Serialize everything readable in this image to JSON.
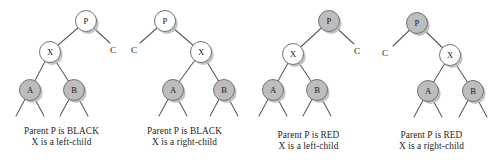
{
  "figure": {
    "kind": "red-black-tree-cases",
    "background": "#ffffff",
    "colors": {
      "node_fill_black": "#ffffff",
      "node_fill_red": "#bdbdbd",
      "node_stroke": "#6e6e6e",
      "edge_stroke": "#5a5a5a",
      "shadow": "#b8b8b8",
      "text": "#241f1f"
    },
    "geometry": {
      "node_radius": 10.5,
      "panel_width": 123,
      "panel_height": 166
    }
  },
  "panels": [
    {
      "id": "case-1",
      "x": 0,
      "caption": {
        "line1": "Parent P is BLACK",
        "line2": "X is a left-child",
        "top": 126
      },
      "nodes": [
        {
          "name": "node-p",
          "label": "P",
          "cx": 86,
          "cy": 21,
          "fill": "black"
        },
        {
          "name": "node-x",
          "label": "X",
          "cx": 50,
          "cy": 52,
          "fill": "black"
        },
        {
          "name": "node-a",
          "label": "A",
          "cx": 30,
          "cy": 90,
          "fill": "red"
        },
        {
          "name": "node-b",
          "label": "B",
          "cx": 74,
          "cy": 90,
          "fill": "red"
        }
      ],
      "ext_labels": [
        {
          "name": "label-c",
          "label": "C",
          "x": 113,
          "y": 50
        }
      ],
      "edges": [
        [
          86,
          21,
          50,
          52
        ],
        [
          86,
          21,
          110,
          43
        ],
        [
          50,
          52,
          30,
          90
        ],
        [
          50,
          52,
          74,
          90
        ],
        [
          30,
          90,
          16,
          116
        ],
        [
          30,
          90,
          44,
          116
        ],
        [
          74,
          90,
          60,
          116
        ],
        [
          74,
          90,
          88,
          116
        ]
      ]
    },
    {
      "id": "case-2",
      "x": 123,
      "caption": {
        "line1": "Parent P is BLACK",
        "line2": "X is a right-child",
        "top": 126
      },
      "nodes": [
        {
          "name": "node-p",
          "label": "P",
          "cx": 42,
          "cy": 21,
          "fill": "black"
        },
        {
          "name": "node-x",
          "label": "X",
          "cx": 78,
          "cy": 52,
          "fill": "black"
        },
        {
          "name": "node-a",
          "label": "A",
          "cx": 50,
          "cy": 90,
          "fill": "red"
        },
        {
          "name": "node-b",
          "label": "B",
          "cx": 101,
          "cy": 90,
          "fill": "red"
        }
      ],
      "ext_labels": [
        {
          "name": "label-c",
          "label": "C",
          "x": 11,
          "y": 50
        }
      ],
      "edges": [
        [
          42,
          21,
          78,
          52
        ],
        [
          42,
          21,
          17,
          43
        ],
        [
          78,
          52,
          50,
          90
        ],
        [
          78,
          52,
          101,
          90
        ],
        [
          50,
          90,
          36,
          116
        ],
        [
          50,
          90,
          64,
          116
        ],
        [
          101,
          90,
          87,
          116
        ],
        [
          101,
          90,
          115,
          116
        ]
      ]
    },
    {
      "id": "case-3",
      "x": 247,
      "caption": {
        "line1": "Parent P is RED",
        "line2": "X is a left-child",
        "top": 130
      },
      "nodes": [
        {
          "name": "node-p",
          "label": "P",
          "cx": 82,
          "cy": 21,
          "fill": "red"
        },
        {
          "name": "node-x",
          "label": "X",
          "cx": 46,
          "cy": 54,
          "fill": "black"
        },
        {
          "name": "node-a",
          "label": "A",
          "cx": 26,
          "cy": 90,
          "fill": "red"
        },
        {
          "name": "node-b",
          "label": "B",
          "cx": 70,
          "cy": 90,
          "fill": "red"
        }
      ],
      "ext_labels": [
        {
          "name": "label-c",
          "label": "C",
          "x": 110,
          "y": 51
        }
      ],
      "edges": [
        [
          82,
          21,
          46,
          54
        ],
        [
          82,
          21,
          107,
          44
        ],
        [
          46,
          54,
          26,
          90
        ],
        [
          46,
          54,
          70,
          90
        ],
        [
          26,
          90,
          12,
          116
        ],
        [
          26,
          90,
          40,
          116
        ],
        [
          70,
          90,
          56,
          116
        ],
        [
          70,
          90,
          84,
          116
        ]
      ]
    },
    {
      "id": "case-4",
      "x": 370,
      "caption": {
        "line1": "Parent P is RED",
        "line2": "X is a right-child",
        "top": 130
      },
      "nodes": [
        {
          "name": "node-p",
          "label": "P",
          "cx": 47,
          "cy": 23,
          "fill": "red"
        },
        {
          "name": "node-x",
          "label": "X",
          "cx": 80,
          "cy": 55,
          "fill": "black"
        },
        {
          "name": "node-a",
          "label": "A",
          "cx": 58,
          "cy": 91,
          "fill": "red"
        },
        {
          "name": "node-b",
          "label": "B",
          "cx": 103,
          "cy": 91,
          "fill": "red"
        }
      ],
      "ext_labels": [
        {
          "name": "label-c",
          "label": "C",
          "x": 15,
          "y": 53
        }
      ],
      "edges": [
        [
          47,
          23,
          80,
          55
        ],
        [
          47,
          23,
          23,
          46
        ],
        [
          80,
          55,
          58,
          91
        ],
        [
          80,
          55,
          103,
          91
        ],
        [
          58,
          91,
          44,
          117
        ],
        [
          58,
          91,
          72,
          117
        ],
        [
          103,
          91,
          89,
          117
        ],
        [
          103,
          91,
          117,
          117
        ]
      ]
    }
  ]
}
